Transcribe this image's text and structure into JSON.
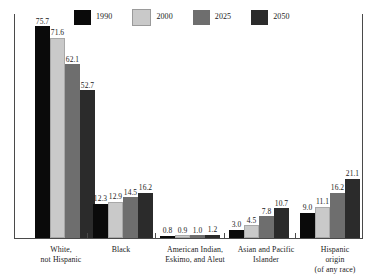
{
  "chart_data": {
    "type": "bar",
    "title": "",
    "subtitle": "",
    "xlabel": "",
    "ylabel": "",
    "ylim": [
      0,
      80
    ],
    "grid": false,
    "legend_position": "top",
    "value_format": "one-decimal-percent",
    "categories": [
      "White, not Hispanic",
      "Black",
      "American Indian, Eskimo, and Aleut",
      "Asian and Pacific Islander",
      "Hispanic origin (of any race)"
    ],
    "category_lines": [
      [
        "White,",
        "not Hispanic"
      ],
      [
        "Black"
      ],
      [
        "American Indian,",
        "Eskimo, and Aleut"
      ],
      [
        "Asian and Pacific",
        "Islander"
      ],
      [
        "Hispanic",
        "origin",
        "(of any race)"
      ]
    ],
    "series": [
      {
        "name": "1990",
        "color": "#0a0a0a",
        "values": [
          75.7,
          12.3,
          0.8,
          3.0,
          9.0
        ]
      },
      {
        "name": "2000",
        "color": "#c9c9c9",
        "values": [
          71.6,
          12.9,
          0.9,
          4.5,
          11.1
        ]
      },
      {
        "name": "2025",
        "color": "#6e6e6e",
        "values": [
          62.1,
          14.5,
          1.0,
          7.8,
          16.2
        ]
      },
      {
        "name": "2050",
        "color": "#2b2b2b",
        "values": [
          52.7,
          16.2,
          1.2,
          10.7,
          21.1
        ]
      }
    ]
  },
  "legend": {
    "items": [
      {
        "label": "1990",
        "color": "#0a0a0a"
      },
      {
        "label": "2000",
        "color": "#c9c9c9"
      },
      {
        "label": "2025",
        "color": "#6e6e6e"
      },
      {
        "label": "2050",
        "color": "#2b2b2b"
      }
    ]
  },
  "axes": {
    "line_color": "#4a4a4a"
  }
}
